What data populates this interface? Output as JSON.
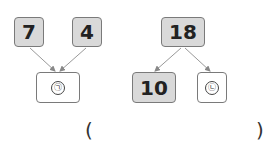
{
  "diagram_left": {
    "top_left": "7",
    "top_right": "4",
    "bottom": "㉠"
  },
  "diagram_right": {
    "top": "18",
    "bottom_left": "10",
    "bottom_right": "㉡"
  },
  "answer": {
    "open_paren": "(",
    "close_paren": ")"
  }
}
